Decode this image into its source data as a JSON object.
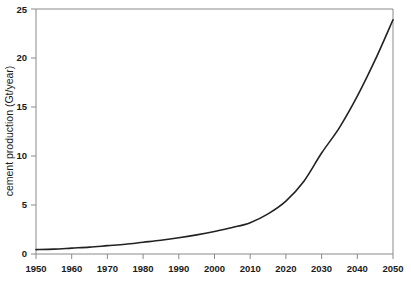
{
  "chart_data": {
    "type": "line",
    "title": "",
    "subtitle": "",
    "xlabel": "",
    "ylabel": "cement production (Gt/year)",
    "xlim": [
      1950,
      2050
    ],
    "ylim": [
      0,
      25
    ],
    "grid": false,
    "legend": null,
    "x_ticks": [
      1950,
      1960,
      1970,
      1980,
      1990,
      2000,
      2010,
      2020,
      2030,
      2040,
      2050
    ],
    "y_ticks": [
      0,
      5,
      10,
      15,
      20,
      25
    ],
    "x": [
      1950,
      1955,
      1960,
      1965,
      1970,
      1975,
      1980,
      1985,
      1990,
      1995,
      2000,
      2005,
      2010,
      2015,
      2020,
      2025,
      2030,
      2035,
      2040,
      2045,
      2050
    ],
    "series": [
      {
        "name": "cement production",
        "color": "#222222",
        "values": [
          0.45,
          0.5,
          0.6,
          0.7,
          0.85,
          1.0,
          1.2,
          1.4,
          1.65,
          1.95,
          2.3,
          2.7,
          3.2,
          4.1,
          5.4,
          7.4,
          10.3,
          12.9,
          16.1,
          19.8,
          23.9
        ]
      }
    ],
    "annotations": []
  },
  "axis": {
    "x_tick_labels": [
      "1950",
      "1960",
      "1970",
      "1980",
      "1990",
      "2000",
      "2010",
      "2020",
      "2030",
      "2040",
      "2050"
    ],
    "y_tick_labels": [
      "0",
      "5",
      "10",
      "15",
      "20",
      "25"
    ],
    "y_axis_title": "cement production (Gt/year)"
  },
  "colors": {
    "curve": "#222222",
    "frame": "#8a8a8a",
    "text": "#1a1a1a",
    "background": "#ffffff"
  }
}
